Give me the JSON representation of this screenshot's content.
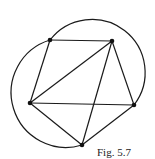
{
  "figure": {
    "caption": "Fig. 5.7",
    "stroke_color": "#1a1a1a",
    "points": [
      {
        "id": "A",
        "x": 50,
        "y": 40
      },
      {
        "id": "B",
        "x": 112,
        "y": 41
      },
      {
        "id": "C",
        "x": 30,
        "y": 103
      },
      {
        "id": "D",
        "x": 134,
        "y": 105
      },
      {
        "id": "E",
        "x": 82,
        "y": 145
      }
    ],
    "segments": [
      [
        "A",
        "B"
      ],
      [
        "A",
        "C"
      ],
      [
        "C",
        "B"
      ],
      [
        "B",
        "D"
      ],
      [
        "C",
        "D"
      ],
      [
        "B",
        "E"
      ],
      [
        "C",
        "E"
      ],
      [
        "E",
        "D"
      ]
    ],
    "arcs": [
      {
        "name": "large-circle-arc",
        "from": "A",
        "to": "D"
      },
      {
        "name": "small-circle-arc",
        "from": "A",
        "to": "E"
      }
    ]
  }
}
